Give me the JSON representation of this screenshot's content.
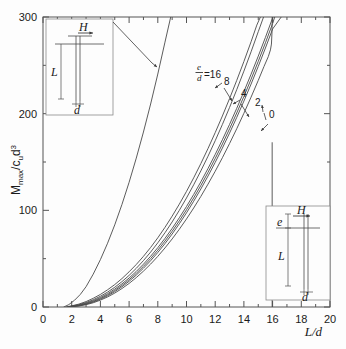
{
  "chart_data": {
    "type": "line",
    "title": "",
    "xlabel": "L/d",
    "ylabel": "Mmax/cu d3",
    "ylabel_parts": {
      "main": "M",
      "sub1": "max",
      "slash": "/",
      "c": "c",
      "sub2": "u",
      "d": "d",
      "sup": "3"
    },
    "xlim": [
      0,
      20
    ],
    "ylim": [
      0,
      300
    ],
    "xticks": [
      0,
      2,
      4,
      6,
      8,
      10,
      12,
      14,
      16,
      18,
      20
    ],
    "yticks": [
      0,
      100,
      200,
      300
    ],
    "yminorticks": [
      50,
      150,
      250
    ],
    "xminorticks": [
      1,
      3,
      5,
      7,
      9,
      11,
      13,
      15,
      17,
      19
    ],
    "grid": false,
    "legend_position": "inline-annotations",
    "legend_title": "e/d",
    "series": [
      {
        "name": "e/d=16",
        "label": "16",
        "points": [
          [
            1.6,
            0
          ],
          [
            2,
            1.2
          ],
          [
            2.5,
            3
          ],
          [
            3,
            5.6
          ],
          [
            3.5,
            9
          ],
          [
            4,
            13
          ],
          [
            4.5,
            17.8
          ],
          [
            5,
            23.2
          ],
          [
            5.5,
            29.4
          ],
          [
            6,
            36.4
          ],
          [
            6.5,
            44
          ],
          [
            7,
            52.4
          ],
          [
            7.5,
            61.6
          ],
          [
            8,
            71.6
          ],
          [
            8.5,
            82.4
          ],
          [
            9,
            94
          ],
          [
            9.5,
            106.4
          ],
          [
            10,
            119.6
          ],
          [
            10.5,
            133.6
          ],
          [
            11,
            148.4
          ],
          [
            11.5,
            164
          ],
          [
            12,
            180.4
          ],
          [
            12.5,
            197.6
          ],
          [
            13,
            215.6
          ],
          [
            13.5,
            234.4
          ],
          [
            14,
            254
          ],
          [
            14.5,
            274.4
          ],
          [
            14.9,
            291.6
          ],
          [
            15.15,
            300
          ]
        ]
      },
      {
        "name": "e/d=8",
        "label": "8",
        "points": [
          [
            1.7,
            0
          ],
          [
            2,
            0.9
          ],
          [
            2.5,
            2.4
          ],
          [
            3,
            4.6
          ],
          [
            3.5,
            7.5
          ],
          [
            4,
            11.1
          ],
          [
            4.5,
            15.4
          ],
          [
            5,
            20.4
          ],
          [
            5.5,
            26.2
          ],
          [
            6,
            32.7
          ],
          [
            6.5,
            40
          ],
          [
            7,
            48
          ],
          [
            7.5,
            56.8
          ],
          [
            8,
            66.4
          ],
          [
            8.5,
            76.8
          ],
          [
            9,
            88
          ],
          [
            9.5,
            100
          ],
          [
            10,
            112.8
          ],
          [
            10.5,
            126.4
          ],
          [
            11,
            140.8
          ],
          [
            11.5,
            156
          ],
          [
            12,
            172
          ],
          [
            12.5,
            188.8
          ],
          [
            13,
            206.4
          ],
          [
            13.5,
            224.8
          ],
          [
            14,
            244
          ],
          [
            14.5,
            264
          ],
          [
            15,
            284.8
          ],
          [
            15.37,
            300
          ]
        ]
      },
      {
        "name": "e/d=4",
        "label": "4",
        "points": [
          [
            1.75,
            0
          ],
          [
            2,
            0.7
          ],
          [
            2.5,
            2
          ],
          [
            3,
            3.9
          ],
          [
            3.5,
            6.5
          ],
          [
            4,
            9.8
          ],
          [
            4.5,
            13.8
          ],
          [
            5,
            18.5
          ],
          [
            5.5,
            23.9
          ],
          [
            6,
            30
          ],
          [
            6.5,
            36.8
          ],
          [
            7,
            44.3
          ],
          [
            7.5,
            52.5
          ],
          [
            8,
            61.4
          ],
          [
            8.5,
            71
          ],
          [
            9,
            81.3
          ],
          [
            9.5,
            92.3
          ],
          [
            10,
            104
          ],
          [
            10.5,
            116.4
          ],
          [
            11,
            129.5
          ],
          [
            11.5,
            143.3
          ],
          [
            12,
            157.8
          ],
          [
            12.5,
            173
          ],
          [
            13,
            188.9
          ],
          [
            13.5,
            205.5
          ],
          [
            14,
            222.8
          ],
          [
            14.5,
            240.8
          ],
          [
            15,
            259.5
          ],
          [
            15.5,
            278.9
          ],
          [
            16,
            299
          ],
          [
            16.03,
            300
          ]
        ]
      },
      {
        "name": "e/d=2",
        "label": "2",
        "points": [
          [
            1.8,
            0
          ],
          [
            2,
            0.5
          ],
          [
            2.5,
            1.6
          ],
          [
            3,
            3.3
          ],
          [
            3.5,
            5.7
          ],
          [
            4,
            8.8
          ],
          [
            4.5,
            12.6
          ],
          [
            5,
            17.1
          ],
          [
            5.5,
            22.3
          ],
          [
            6,
            28.2
          ],
          [
            6.5,
            34.8
          ],
          [
            7,
            42.1
          ],
          [
            7.5,
            50.1
          ],
          [
            8,
            58.8
          ],
          [
            8.5,
            68.2
          ],
          [
            9,
            78.3
          ],
          [
            9.5,
            89.1
          ],
          [
            10,
            100.6
          ],
          [
            10.5,
            112.8
          ],
          [
            11,
            125.7
          ],
          [
            11.5,
            139.3
          ],
          [
            12,
            153.6
          ],
          [
            12.5,
            168.6
          ],
          [
            13,
            184.3
          ],
          [
            13.5,
            200.7
          ],
          [
            14,
            217.8
          ],
          [
            14.5,
            235.6
          ],
          [
            15,
            254.1
          ],
          [
            15.5,
            273.3
          ],
          [
            16,
            293.2
          ],
          [
            16.15,
            300
          ]
        ]
      },
      {
        "name": "e/d=1",
        "label": "",
        "points": [
          [
            1.85,
            0
          ],
          [
            2,
            0.35
          ],
          [
            2.5,
            1.3
          ],
          [
            3,
            2.9
          ],
          [
            3.5,
            5.1
          ],
          [
            4,
            8
          ],
          [
            4.5,
            11.6
          ],
          [
            5,
            15.9
          ],
          [
            5.5,
            20.9
          ],
          [
            6,
            26.6
          ],
          [
            6.5,
            33
          ],
          [
            7,
            40.1
          ],
          [
            7.5,
            47.9
          ],
          [
            8,
            56.4
          ],
          [
            8.5,
            65.6
          ],
          [
            9,
            75.5
          ],
          [
            9.5,
            86.1
          ],
          [
            10,
            97.4
          ],
          [
            10.5,
            109.4
          ],
          [
            11,
            122.1
          ],
          [
            11.5,
            135.5
          ],
          [
            12,
            149.6
          ],
          [
            12.5,
            164.4
          ],
          [
            13,
            179.9
          ],
          [
            13.5,
            196.1
          ],
          [
            14,
            213
          ],
          [
            14.5,
            230.6
          ],
          [
            15,
            248.9
          ],
          [
            15.5,
            267.9
          ],
          [
            16,
            287.6
          ],
          [
            16.6,
            300
          ]
        ]
      },
      {
        "name": "e/d=0",
        "label": "0",
        "points": [
          [
            1.9,
            0
          ],
          [
            2,
            0.2
          ],
          [
            2.5,
            1
          ],
          [
            3,
            2.4
          ],
          [
            3.5,
            4.4
          ],
          [
            4,
            7.1
          ],
          [
            4.5,
            10.4
          ],
          [
            5,
            14.4
          ],
          [
            5.5,
            19.1
          ],
          [
            6,
            24.4
          ],
          [
            6.5,
            30.4
          ],
          [
            7,
            37.1
          ],
          [
            7.5,
            44.4
          ],
          [
            8,
            52.4
          ],
          [
            8.5,
            61.1
          ],
          [
            9,
            70.4
          ],
          [
            9.5,
            80.4
          ],
          [
            10,
            91.1
          ],
          [
            10.5,
            102.4
          ],
          [
            11,
            114.4
          ],
          [
            11.5,
            127.1
          ],
          [
            12,
            140.4
          ],
          [
            12.5,
            154.4
          ],
          [
            13,
            169.1
          ],
          [
            13.5,
            184.4
          ],
          [
            14,
            200.4
          ],
          [
            14.5,
            217.1
          ],
          [
            15,
            234.4
          ],
          [
            15.4,
            248.8
          ],
          [
            15.7,
            259
          ],
          [
            15.85,
            266
          ],
          [
            15.92,
            272
          ],
          [
            15.96,
            285
          ],
          [
            15.97,
            300
          ]
        ]
      },
      {
        "name": "free-head-steep",
        "label": "",
        "points": [
          [
            1.45,
            0
          ],
          [
            1.8,
            2.5
          ],
          [
            2.2,
            7
          ],
          [
            2.6,
            13
          ],
          [
            3,
            21
          ],
          [
            3.5,
            34
          ],
          [
            4,
            49
          ],
          [
            4.5,
            66
          ],
          [
            5,
            85
          ],
          [
            5.5,
            106
          ],
          [
            6,
            129
          ],
          [
            6.5,
            154
          ],
          [
            7,
            181
          ],
          [
            7.5,
            210
          ],
          [
            8,
            241
          ],
          [
            8.5,
            274
          ],
          [
            8.9,
            300
          ]
        ]
      },
      {
        "name": "fixed-head-vertical-tail",
        "label": "",
        "points": [
          [
            15.97,
            0
          ],
          [
            15.97,
            170
          ]
        ]
      }
    ],
    "annotations": [
      {
        "name": "series-label-ed16",
        "text": "=16",
        "x": 12.05,
        "y": 256
      },
      {
        "name": "series-label-8",
        "text": "8",
        "x": 13.35,
        "y": 247
      },
      {
        "name": "series-label-4",
        "text": "4",
        "x": 14.55,
        "y": 232
      },
      {
        "name": "series-label-2",
        "text": "2",
        "x": 15.5,
        "y": 220
      },
      {
        "name": "series-label-0",
        "text": "0",
        "x": 16.55,
        "y": 203
      }
    ]
  },
  "insets": {
    "top_left": {
      "name": "fixed-head-pile-diagram",
      "labels": {
        "force": "H",
        "length": "L",
        "diameter": "d"
      }
    },
    "bottom_right": {
      "name": "free-head-pile-diagram",
      "labels": {
        "eccentricity": "e",
        "force": "H",
        "length": "L",
        "diameter": "d"
      }
    }
  },
  "style": {
    "curve_color": "#4a4a4a",
    "axis_color": "#555555",
    "inset_border": "#8a8a8a",
    "background": "#fdfdfd",
    "text_color": "#1a1a1a"
  }
}
